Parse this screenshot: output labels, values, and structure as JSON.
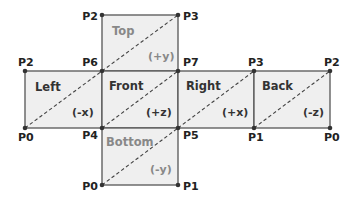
{
  "diagram": {
    "colors": {
      "face_fill": "#efefef",
      "edge": "#555555",
      "text_dark": "#333333",
      "text_gray": "#888888"
    },
    "faces": [
      {
        "name": "Top",
        "axis": "(+y)",
        "gray": true
      },
      {
        "name": "Left",
        "axis": "(-x)",
        "gray": false
      },
      {
        "name": "Front",
        "axis": "(+z)",
        "gray": false
      },
      {
        "name": "Right",
        "axis": "(+x)",
        "gray": false
      },
      {
        "name": "Back",
        "axis": "(-z)",
        "gray": false
      },
      {
        "name": "Bottom",
        "axis": "(-y)",
        "gray": true
      }
    ],
    "points": {
      "top_tl": "P2",
      "top_tr": "P3",
      "left_tl": "P2",
      "left_bl": "P0",
      "front_tl": "P6",
      "front_tr": "P7",
      "front_bl": "P4",
      "front_br": "P5",
      "back_tl": "P3",
      "back_bl": "P1",
      "back_tr": "P2",
      "back_br": "P0",
      "bottom_bl": "P0",
      "bottom_br": "P1"
    }
  }
}
